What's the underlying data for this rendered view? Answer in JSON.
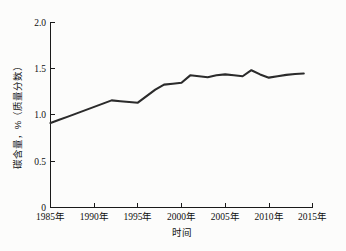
{
  "chart_data": {
    "type": "line",
    "title": "",
    "xlabel": "时间",
    "ylabel": "碳含量，%（质量分数）",
    "xlim": [
      1985,
      2015
    ],
    "ylim": [
      0,
      2.0
    ],
    "grid": false,
    "legend": null,
    "xticklabels": [
      "1985年",
      "1990年",
      "1995年",
      "2000年",
      "2005年",
      "2010年",
      "2015年"
    ],
    "xticks": [
      1985,
      1990,
      1995,
      2000,
      2005,
      2010,
      2015
    ],
    "yticklabels": [
      "0",
      "0.5",
      "1.0",
      "1.5",
      "2.0"
    ],
    "yticks": [
      0,
      0.5,
      1.0,
      1.5,
      2.0
    ],
    "series": [
      {
        "name": "碳含量",
        "color": "#2b2b2b",
        "x": [
          1985,
          1986,
          1987,
          1988,
          1989,
          1990,
          1991,
          1992,
          1993,
          1994,
          1995,
          1996,
          1997,
          1998,
          1999,
          2000,
          2001,
          2002,
          2003,
          2004,
          2005,
          2006,
          2007,
          2008,
          2009,
          2010,
          2011,
          2012,
          2013,
          2014
        ],
        "values": [
          0.91,
          0.945,
          0.98,
          1.015,
          1.05,
          1.085,
          1.12,
          1.155,
          1.145,
          1.137,
          1.13,
          1.2,
          1.27,
          1.325,
          1.335,
          1.345,
          1.425,
          1.415,
          1.405,
          1.425,
          1.435,
          1.425,
          1.415,
          1.48,
          1.435,
          1.4,
          1.415,
          1.43,
          1.44,
          1.445
        ]
      }
    ]
  }
}
